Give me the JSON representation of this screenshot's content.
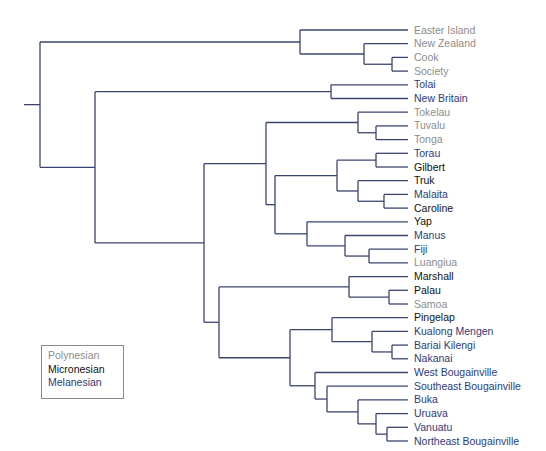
{
  "colors": {
    "line": "#3b4470",
    "Polynesian": "#8c8c8c",
    "Micronesian": "#111111",
    "Melanesian": "#2e3a7c"
  },
  "legend": {
    "items": [
      {
        "label": "Polynesian",
        "group": "Polynesian"
      },
      {
        "label": "Micronesian",
        "group": "Micronesian"
      },
      {
        "label": "Melanesian",
        "group": "Melanesian"
      }
    ]
  },
  "leaves": [
    {
      "label": "Easter Island",
      "group": "Polynesian"
    },
    {
      "label": "New Zealand",
      "group": "Polynesian"
    },
    {
      "label": "Cook",
      "group": "Polynesian"
    },
    {
      "label": "Society",
      "group": "Polynesian"
    },
    {
      "label": "Tolai",
      "group": "Melanesian"
    },
    {
      "label": "New Britain",
      "group": "Melanesian"
    },
    {
      "label": "Tokelau",
      "group": "Polynesian"
    },
    {
      "label": "Tuvalu",
      "group": "Polynesian"
    },
    {
      "label": "Tonga",
      "group": "Polynesian"
    },
    {
      "label": "Torau",
      "group": "Melanesian"
    },
    {
      "label": "Gilbert",
      "group": "Micronesian"
    },
    {
      "label": "Truk",
      "group": "Micronesian"
    },
    {
      "label": "Malaita",
      "group": "Melanesian"
    },
    {
      "label": "Caroline",
      "group": "Micronesian"
    },
    {
      "label": "Yap",
      "group": "Micronesian"
    },
    {
      "label": "Manus",
      "group": "Melanesian"
    },
    {
      "label": "Fiji",
      "group": "Melanesian"
    },
    {
      "label": "Luangiua",
      "group": "Polynesian"
    },
    {
      "label": "Marshall",
      "group": "Micronesian"
    },
    {
      "label": "Palau",
      "group": "Micronesian"
    },
    {
      "label": "Samoa",
      "group": "Polynesian"
    },
    {
      "label": "Pingelap",
      "group": "Micronesian"
    },
    {
      "label": "Kualong Mengen",
      "group": "Melanesian"
    },
    {
      "label": "Bariai Kilengi",
      "group": "Melanesian"
    },
    {
      "label": "Nakanai",
      "group": "Melanesian"
    },
    {
      "label": "West Bougainville",
      "group": "Melanesian"
    },
    {
      "label": "Southeast Bougainville",
      "group": "Melanesian"
    },
    {
      "label": "Buka",
      "group": "Melanesian"
    },
    {
      "label": "Uruava",
      "group": "Melanesian"
    },
    {
      "label": "Vanuatu",
      "group": "Melanesian"
    },
    {
      "label": "Northeast Bougainville",
      "group": "Melanesian"
    }
  ],
  "tree": {
    "x": 40,
    "children": [
      {
        "x": 300,
        "children": [
          {
            "leaf": 0
          },
          {
            "x": 364,
            "children": [
              {
                "leaf": 1
              },
              {
                "x": 392,
                "children": [
                  {
                    "leaf": 2
                  },
                  {
                    "leaf": 3
                  }
                ]
              }
            ]
          }
        ]
      },
      {
        "x": 95,
        "children": [
          {
            "x": 331,
            "children": [
              {
                "leaf": 4
              },
              {
                "leaf": 5
              }
            ]
          },
          {
            "x": 204,
            "children": [
              {
                "x": 266,
                "children": [
                  {
                    "x": 358,
                    "children": [
                      {
                        "leaf": 6
                      },
                      {
                        "x": 376,
                        "children": [
                          {
                            "leaf": 7
                          },
                          {
                            "leaf": 8
                          }
                        ]
                      }
                    ]
                  },
                  {
                    "x": 275,
                    "children": [
                      {
                        "x": 337,
                        "children": [
                          {
                            "x": 376,
                            "children": [
                              {
                                "leaf": 9
                              },
                              {
                                "leaf": 10
                              }
                            ]
                          },
                          {
                            "x": 358,
                            "children": [
                              {
                                "leaf": 11
                              },
                              {
                                "x": 384,
                                "children": [
                                  {
                                    "leaf": 12
                                  },
                                  {
                                    "leaf": 13
                                  }
                                ]
                              }
                            ]
                          }
                        ]
                      },
                      {
                        "x": 307,
                        "children": [
                          {
                            "leaf": 14
                          },
                          {
                            "x": 345,
                            "children": [
                              {
                                "leaf": 15
                              },
                              {
                                "x": 369,
                                "children": [
                                  {
                                    "leaf": 16
                                  },
                                  {
                                    "leaf": 17
                                  }
                                ]
                              }
                            ]
                          }
                        ]
                      }
                    ]
                  }
                ]
              },
              {
                "x": 219,
                "children": [
                  {
                    "x": 349,
                    "children": [
                      {
                        "leaf": 18
                      },
                      {
                        "x": 389,
                        "children": [
                          {
                            "leaf": 19
                          },
                          {
                            "leaf": 20
                          }
                        ]
                      }
                    ]
                  },
                  {
                    "x": 290,
                    "children": [
                      {
                        "x": 332,
                        "children": [
                          {
                            "leaf": 21
                          },
                          {
                            "x": 372,
                            "children": [
                              {
                                "leaf": 22
                              },
                              {
                                "x": 392,
                                "children": [
                                  {
                                    "leaf": 23
                                  },
                                  {
                                    "leaf": 24
                                  }
                                ]
                              }
                            ]
                          }
                        ]
                      },
                      {
                        "x": 315,
                        "children": [
                          {
                            "leaf": 25
                          },
                          {
                            "x": 327,
                            "children": [
                              {
                                "leaf": 26
                              },
                              {
                                "x": 358,
                                "children": [
                                  {
                                    "leaf": 27
                                  },
                                  {
                                    "x": 376,
                                    "children": [
                                      {
                                        "leaf": 28
                                      },
                                      {
                                        "x": 387,
                                        "children": [
                                          {
                                            "leaf": 29
                                          },
                                          {
                                            "leaf": 30
                                          }
                                        ]
                                      }
                                    ]
                                  }
                                ]
                              }
                            ]
                          }
                        ]
                      }
                    ]
                  }
                ]
              }
            ]
          }
        ]
      }
    ]
  },
  "layout": {
    "root_stub_x": 24,
    "leaf_end_x": 408,
    "label_x": 414,
    "first_leaf_y": 30,
    "leaf_step": 13.7
  }
}
